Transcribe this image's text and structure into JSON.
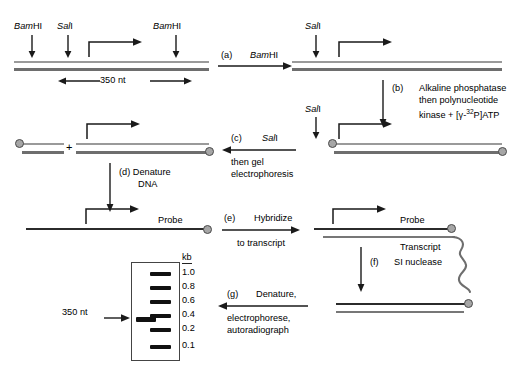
{
  "figure": {
    "units_label": "kb"
  },
  "row1": {
    "enzyme_left": {
      "italic": "Bam",
      "roman": "HI"
    },
    "enzyme_mid": {
      "italic": "Sal",
      "roman": "I"
    },
    "enzyme_right": {
      "italic": "Bam",
      "roman": "HI"
    },
    "length_label": "350 nt"
  },
  "row1_right": {
    "enzyme_sal": {
      "italic": "Sal",
      "roman": "I"
    }
  },
  "row2": {
    "enzyme_sal": {
      "italic": "Sal",
      "roman": "I"
    }
  },
  "row4": {
    "probe_label": "Probe"
  },
  "row5": {
    "probe_label": "Probe",
    "transcript_label": "Transcript"
  },
  "gel": {
    "kb_header": "kb",
    "markers": [
      "1.0",
      "0.8",
      "0.6",
      "0.4",
      "0.2",
      "0.1"
    ],
    "sample_label": "350 nt"
  },
  "steps": {
    "a": {
      "tag": "(a)",
      "text_italic": "Bam",
      "text_roman": "HI"
    },
    "b": {
      "tag": "(b)",
      "line1": "Alkaline phosphatase",
      "line2": "then polynucleotide",
      "line3_pre": "kinase + [",
      "line3_greek": "γ",
      "line3_mid": "-",
      "line3_sup": "32",
      "line3_post": "P]ATP"
    },
    "c": {
      "tag": "(c)",
      "enzyme_italic": "Sal",
      "enzyme_roman": "I",
      "line2": "then gel",
      "line3": "electrophoresis"
    },
    "d": {
      "tag": "(d)",
      "line1": "Denature",
      "line2": "DNA"
    },
    "e": {
      "tag": "(e)",
      "line1": "Hybridize",
      "line2": "to transcript"
    },
    "f": {
      "tag": "(f)",
      "line1": "SI nuclease"
    },
    "g": {
      "tag": "(g)",
      "line1": "Denature,",
      "line2": "electrophorese,",
      "line3": "autoradiograph"
    }
  },
  "colors": {
    "strand_light": "#9a9a9a",
    "strand_dark": "#6e6e6e",
    "strand_black": "#2b2b2b",
    "label_circle_fill": "#a6a6a6",
    "label_circle_stroke": "#4a4a4a",
    "band": "#111111",
    "text": "#000000"
  }
}
